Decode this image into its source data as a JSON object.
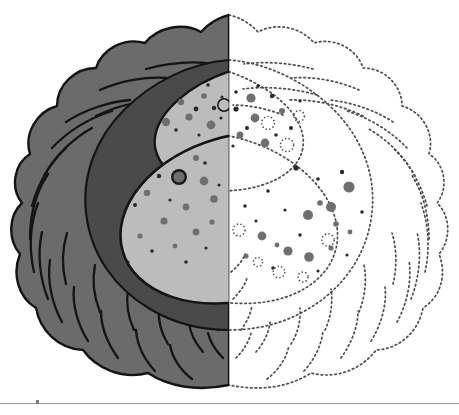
{
  "figure": {
    "canvas": {
      "width": 459,
      "height": 415,
      "background": "#ffffff"
    },
    "split_x": 229
  },
  "palette": {
    "outer_coat_fill": "#6b6b6b",
    "inner_shadow_fill": "#4a4a4a",
    "body_fill": "#bcbcbc",
    "stroke_dark": "#141414",
    "granule_dark": "#2a2a2a",
    "granule_mid": "#6f6f6f",
    "granule_ring": "#1a1a1a",
    "dotted_stroke": "#4d4d4d",
    "baseline": "#9a9a9a",
    "white": "#ffffff"
  },
  "parts": [
    {
      "id": "outer-coat",
      "label": "Outer lobed coat",
      "side": "left",
      "render": "filled",
      "fill": "#6b6b6b"
    },
    {
      "id": "outer-coat-ghost",
      "label": "Outer lobed coat",
      "side": "right",
      "render": "dotted",
      "fill": "none"
    },
    {
      "id": "coat-striations",
      "label": "Coat arc striations",
      "side": "left",
      "render": "stroked",
      "count": 26
    },
    {
      "id": "coat-striations-ghost",
      "label": "Coat arc striations",
      "side": "right",
      "render": "dotted",
      "count": 26
    },
    {
      "id": "inner-shadow",
      "label": "Inner cavity shadow",
      "side": "left",
      "render": "filled",
      "fill": "#4a4a4a"
    },
    {
      "id": "upper-lobe",
      "label": "Upper granular lobe",
      "side": "left",
      "render": "filled",
      "fill": "#bcbcbc"
    },
    {
      "id": "upper-lobe-ghost",
      "label": "Upper granular lobe",
      "side": "right",
      "render": "dotted",
      "fill": "none"
    },
    {
      "id": "lower-lobe",
      "label": "Lower granular lobe",
      "side": "left",
      "render": "filled",
      "fill": "#bcbcbc"
    },
    {
      "id": "lower-lobe-ghost",
      "label": "Lower granular lobe",
      "side": "right",
      "render": "dotted",
      "fill": "none"
    }
  ],
  "granule_classes": [
    {
      "id": "ring",
      "label": "Large ringed granule",
      "style": "dark ring, mid-gray core"
    },
    {
      "id": "solid",
      "label": "Solid gray granule",
      "style": "uniform mid-gray disc"
    },
    {
      "id": "speck",
      "label": "Fine dark speck",
      "style": "small near-black dot"
    },
    {
      "id": "open",
      "label": "Open outlined vesicle",
      "style": "unfilled circle outline"
    }
  ],
  "baseline": {
    "y": 403,
    "tick_x": 36,
    "label": ""
  },
  "shapes": {
    "outer_lobe_radii": {
      "rx": 210,
      "ry": 185,
      "cx": 229,
      "cy": 200,
      "lobes": 22,
      "amplitude": 8
    },
    "inner_cavity": {
      "cx": 236,
      "cy": 190,
      "rx": 150,
      "ry": 132
    },
    "upper_lobe": {
      "cx": 265,
      "cy": 126,
      "rx": 112,
      "ry": 62,
      "rotate": -12
    },
    "lower_lobe": {
      "cx": 238,
      "cy": 218,
      "rx": 120,
      "ry": 82,
      "rotate": -16
    }
  },
  "granules_left_lower": [
    {
      "x": 112,
      "y": 169,
      "r": 7.0,
      "c": "ring"
    },
    {
      "x": 152,
      "y": 162,
      "r": 6.6,
      "c": "ring"
    },
    {
      "x": 179,
      "y": 177,
      "r": 6.8,
      "c": "ring"
    },
    {
      "x": 98,
      "y": 217,
      "r": 6.6,
      "c": "ring"
    },
    {
      "x": 133,
      "y": 156,
      "r": 3.6,
      "c": "solid"
    },
    {
      "x": 166,
      "y": 151,
      "r": 3.2,
      "c": "solid"
    },
    {
      "x": 196,
      "y": 158,
      "r": 3.0,
      "c": "solid"
    },
    {
      "x": 126,
      "y": 185,
      "r": 4.4,
      "c": "solid"
    },
    {
      "x": 147,
      "y": 193,
      "r": 3.2,
      "c": "solid"
    },
    {
      "x": 204,
      "y": 181,
      "r": 4.4,
      "c": "solid"
    },
    {
      "x": 214,
      "y": 199,
      "r": 3.8,
      "c": "solid"
    },
    {
      "x": 186,
      "y": 207,
      "r": 3.4,
      "c": "solid"
    },
    {
      "x": 105,
      "y": 196,
      "r": 3.0,
      "c": "solid"
    },
    {
      "x": 120,
      "y": 212,
      "r": 2.8,
      "c": "solid"
    },
    {
      "x": 164,
      "y": 221,
      "r": 3.6,
      "c": "solid"
    },
    {
      "x": 196,
      "y": 232,
      "r": 3.4,
      "c": "solid"
    },
    {
      "x": 140,
      "y": 236,
      "r": 2.6,
      "c": "solid"
    },
    {
      "x": 175,
      "y": 246,
      "r": 2.4,
      "c": "solid"
    },
    {
      "x": 212,
      "y": 222,
      "r": 2.6,
      "c": "solid"
    },
    {
      "x": 92,
      "y": 189,
      "r": 2.0,
      "c": "speck"
    },
    {
      "x": 118,
      "y": 146,
      "r": 1.8,
      "c": "speck"
    },
    {
      "x": 143,
      "y": 142,
      "r": 1.6,
      "c": "speck"
    },
    {
      "x": 190,
      "y": 147,
      "r": 1.8,
      "c": "speck"
    },
    {
      "x": 108,
      "y": 160,
      "r": 1.6,
      "c": "speck"
    },
    {
      "x": 159,
      "y": 176,
      "r": 2.2,
      "c": "speck"
    },
    {
      "x": 135,
      "y": 205,
      "r": 2.0,
      "c": "speck"
    },
    {
      "x": 170,
      "y": 200,
      "r": 1.6,
      "c": "speck"
    },
    {
      "x": 205,
      "y": 163,
      "r": 1.8,
      "c": "speck"
    },
    {
      "x": 90,
      "y": 205,
      "r": 1.6,
      "c": "speck"
    },
    {
      "x": 110,
      "y": 232,
      "r": 2.0,
      "c": "speck"
    },
    {
      "x": 152,
      "y": 251,
      "r": 1.8,
      "c": "speck"
    },
    {
      "x": 128,
      "y": 262,
      "r": 1.6,
      "c": "speck"
    },
    {
      "x": 186,
      "y": 262,
      "r": 1.8,
      "c": "speck"
    },
    {
      "x": 206,
      "y": 248,
      "r": 1.6,
      "c": "speck"
    },
    {
      "x": 219,
      "y": 185,
      "r": 1.6,
      "c": "speck"
    },
    {
      "x": 97,
      "y": 178,
      "r": 1.6,
      "c": "speck"
    },
    {
      "x": 160,
      "y": 133,
      "r": 1.4,
      "c": "speck"
    },
    {
      "x": 178,
      "y": 137,
      "r": 1.4,
      "c": "speck"
    }
  ],
  "granules_left_upper": [
    {
      "x": 166,
      "y": 122,
      "r": 4.2,
      "c": "solid"
    },
    {
      "x": 189,
      "y": 117,
      "r": 3.6,
      "c": "solid"
    },
    {
      "x": 211,
      "y": 125,
      "r": 4.4,
      "c": "solid"
    },
    {
      "x": 181,
      "y": 102,
      "r": 3.2,
      "c": "solid"
    },
    {
      "x": 204,
      "y": 96,
      "r": 2.8,
      "c": "solid"
    },
    {
      "x": 160,
      "y": 108,
      "r": 2.0,
      "c": "speck"
    },
    {
      "x": 196,
      "y": 109,
      "r": 2.4,
      "c": "speck"
    },
    {
      "x": 214,
      "y": 108,
      "r": 2.2,
      "c": "speck"
    },
    {
      "x": 172,
      "y": 94,
      "r": 1.8,
      "c": "speck"
    },
    {
      "x": 190,
      "y": 88,
      "r": 1.6,
      "c": "speck"
    },
    {
      "x": 208,
      "y": 85,
      "r": 1.8,
      "c": "speck"
    },
    {
      "x": 222,
      "y": 97,
      "r": 1.6,
      "c": "speck"
    },
    {
      "x": 176,
      "y": 130,
      "r": 1.8,
      "c": "speck"
    },
    {
      "x": 199,
      "y": 135,
      "r": 1.6,
      "c": "speck"
    },
    {
      "x": 221,
      "y": 118,
      "r": 1.6,
      "c": "speck"
    },
    {
      "x": 155,
      "y": 120,
      "r": 1.4,
      "c": "speck"
    },
    {
      "x": 224,
      "y": 105,
      "r": 6.2,
      "c": "open"
    }
  ],
  "granules_right_upper": [
    {
      "x": 251,
      "y": 98,
      "r": 4.6,
      "c": "solid"
    },
    {
      "x": 255,
      "y": 118,
      "r": 4.4,
      "c": "solid"
    },
    {
      "x": 240,
      "y": 135,
      "r": 3.4,
      "c": "solid"
    },
    {
      "x": 265,
      "y": 143,
      "r": 4.4,
      "c": "solid"
    },
    {
      "x": 282,
      "y": 111,
      "r": 3.0,
      "c": "solid"
    },
    {
      "x": 236,
      "y": 109,
      "r": 2.6,
      "c": "speck"
    },
    {
      "x": 247,
      "y": 128,
      "r": 2.0,
      "c": "speck"
    },
    {
      "x": 272,
      "y": 96,
      "r": 2.2,
      "c": "speck"
    },
    {
      "x": 291,
      "y": 128,
      "r": 2.0,
      "c": "speck"
    },
    {
      "x": 258,
      "y": 86,
      "r": 1.8,
      "c": "speck"
    },
    {
      "x": 300,
      "y": 101,
      "r": 1.6,
      "c": "speck"
    },
    {
      "x": 236,
      "y": 92,
      "r": 1.8,
      "c": "speck"
    },
    {
      "x": 276,
      "y": 135,
      "r": 1.8,
      "c": "speck"
    },
    {
      "x": 233,
      "y": 146,
      "r": 1.6,
      "c": "speck"
    },
    {
      "x": 268,
      "y": 123,
      "r": 6.4,
      "c": "open"
    },
    {
      "x": 287,
      "y": 145,
      "r": 6.6,
      "c": "open"
    },
    {
      "x": 299,
      "y": 116,
      "r": 5.4,
      "c": "open"
    }
  ],
  "granules_right_lower": [
    {
      "x": 349,
      "y": 187,
      "r": 5.6,
      "c": "solid"
    },
    {
      "x": 331,
      "y": 207,
      "r": 5.0,
      "c": "solid"
    },
    {
      "x": 308,
      "y": 215,
      "r": 5.0,
      "c": "solid"
    },
    {
      "x": 262,
      "y": 236,
      "r": 4.4,
      "c": "solid"
    },
    {
      "x": 288,
      "y": 251,
      "r": 4.6,
      "c": "solid"
    },
    {
      "x": 309,
      "y": 257,
      "r": 4.8,
      "c": "solid"
    },
    {
      "x": 320,
      "y": 203,
      "r": 2.8,
      "c": "solid"
    },
    {
      "x": 336,
      "y": 224,
      "r": 2.8,
      "c": "solid"
    },
    {
      "x": 277,
      "y": 245,
      "r": 2.4,
      "c": "solid"
    },
    {
      "x": 246,
      "y": 256,
      "r": 2.6,
      "c": "solid"
    },
    {
      "x": 331,
      "y": 248,
      "r": 2.6,
      "c": "solid"
    },
    {
      "x": 350,
      "y": 232,
      "r": 2.4,
      "c": "solid"
    },
    {
      "x": 296,
      "y": 168,
      "r": 2.6,
      "c": "speck"
    },
    {
      "x": 342,
      "y": 172,
      "r": 2.2,
      "c": "speck"
    },
    {
      "x": 318,
      "y": 179,
      "r": 1.8,
      "c": "speck"
    },
    {
      "x": 268,
      "y": 191,
      "r": 1.8,
      "c": "speck"
    },
    {
      "x": 245,
      "y": 206,
      "r": 1.8,
      "c": "speck"
    },
    {
      "x": 256,
      "y": 221,
      "r": 1.6,
      "c": "speck"
    },
    {
      "x": 285,
      "y": 210,
      "r": 1.6,
      "c": "speck"
    },
    {
      "x": 300,
      "y": 235,
      "r": 1.8,
      "c": "speck"
    },
    {
      "x": 273,
      "y": 268,
      "r": 1.8,
      "c": "speck"
    },
    {
      "x": 318,
      "y": 271,
      "r": 1.6,
      "c": "speck"
    },
    {
      "x": 347,
      "y": 255,
      "r": 1.6,
      "c": "speck"
    },
    {
      "x": 362,
      "y": 212,
      "r": 1.8,
      "c": "speck"
    },
    {
      "x": 239,
      "y": 230,
      "r": 6.0,
      "c": "open"
    },
    {
      "x": 328,
      "y": 240,
      "r": 6.2,
      "c": "open"
    },
    {
      "x": 279,
      "y": 272,
      "r": 5.8,
      "c": "open"
    },
    {
      "x": 303,
      "y": 277,
      "r": 5.0,
      "c": "open"
    },
    {
      "x": 258,
      "y": 262,
      "r": 4.6,
      "c": "open"
    }
  ]
}
